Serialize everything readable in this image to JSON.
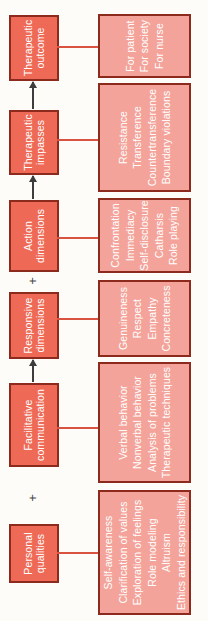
{
  "figure": {
    "plus_glyph": "+",
    "operators": [
      "plus",
      "arrow",
      "plus",
      "arrow",
      "arrow"
    ],
    "stages": [
      {
        "id": "personal-qualities",
        "label_lines": [
          "Personal",
          "qualities"
        ],
        "detail_lines": [
          "Self-awareness",
          "Clarification of values",
          "Exploration of feelings",
          "Role modeling",
          "Altruism",
          "Ethics and responsibility"
        ]
      },
      {
        "id": "facilitative-communication",
        "label_lines": [
          "Facilitative",
          "communication"
        ],
        "detail_lines": [
          "Verbal behavior",
          "Nonverbal behavior",
          "Analysis of problems",
          "Therapeutic techniques"
        ]
      },
      {
        "id": "responsive-dimensions",
        "label_lines": [
          "Responsive",
          "dimensions"
        ],
        "detail_lines": [
          "Genuineness",
          "Respect",
          "Empathy",
          "Concreteness"
        ]
      },
      {
        "id": "action-dimensions",
        "label_lines": [
          "Action",
          "dimensions"
        ],
        "detail_lines": [
          "Confrontation",
          "Immediacy",
          "Self-disclosure",
          "Catharsis",
          "Role playing"
        ]
      },
      {
        "id": "therapeutic-impasses",
        "label_lines": [
          "Therapeutic",
          "impasses"
        ],
        "detail_lines": [
          "Resistance",
          "Transference",
          "Countertransference",
          "Boundary violations"
        ]
      },
      {
        "id": "therapeutic-outcome",
        "label_lines": [
          "Therapeutic",
          "outcome"
        ],
        "detail_lines": [
          "For patient",
          "For society",
          "For nurse"
        ]
      }
    ]
  },
  "colors": {
    "stage_fill": "#ee6a57",
    "detail_fill": "#f3a39a",
    "box_border": "#8b2a1d",
    "connector_line": "#d95341",
    "arrow": "#3d3d3d",
    "text": "#ffffff",
    "background": "#fdfcf9"
  }
}
